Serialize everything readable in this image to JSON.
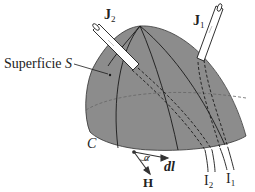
{
  "figure": {
    "surface_label": "Superficie",
    "surface_symbol": "S",
    "contour_label": "C",
    "current_density_1": {
      "symbol": "J",
      "subscript": "1"
    },
    "current_density_2": {
      "symbol": "J",
      "subscript": "2"
    },
    "current_1": {
      "symbol": "I",
      "subscript": "1"
    },
    "current_2": {
      "symbol": "I",
      "subscript": "2"
    },
    "field_vector": "H",
    "line_element": "dl",
    "angle": "α",
    "colors": {
      "surface_fill": "#8c8c8c",
      "lines": "#1a1a1a",
      "tube_fill": "#ffffff",
      "dashed_hidden": "#555555"
    }
  }
}
